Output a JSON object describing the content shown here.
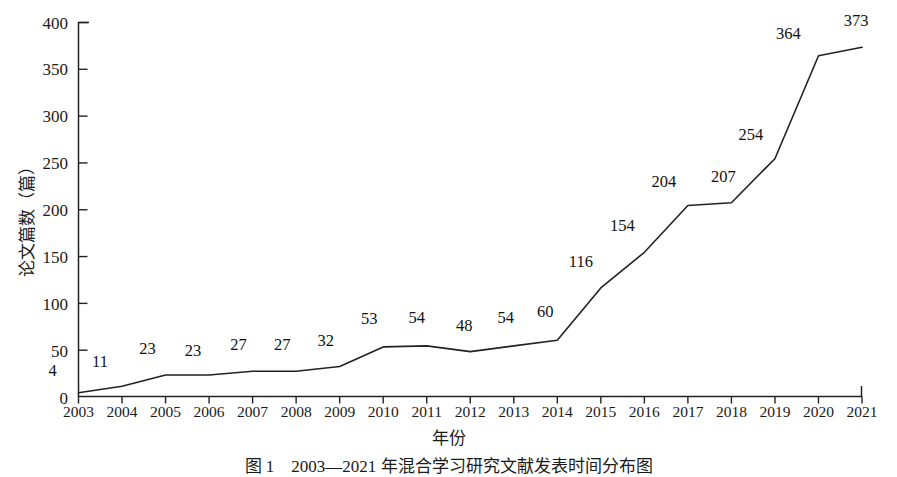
{
  "chart_data": {
    "type": "line",
    "title": "",
    "xlabel": "年份",
    "ylabel": "论文篇数（篇）",
    "categories": [
      "2003",
      "2004",
      "2005",
      "2006",
      "2007",
      "2008",
      "2009",
      "2010",
      "2011",
      "2012",
      "2013",
      "2014",
      "2015",
      "2016",
      "2017",
      "2018",
      "2019",
      "2020",
      "2021"
    ],
    "values": [
      4,
      11,
      23,
      23,
      27,
      27,
      32,
      53,
      54,
      48,
      54,
      60,
      116,
      154,
      204,
      207,
      254,
      364,
      373
    ],
    "series": [
      {
        "name": "论文篇数",
        "values": [
          4,
          11,
          23,
          23,
          27,
          27,
          32,
          53,
          54,
          48,
          54,
          60,
          116,
          154,
          204,
          207,
          254,
          364,
          373
        ]
      }
    ],
    "ylim": [
      0,
      400
    ],
    "ytick_labels": [
      "0",
      "50",
      "100",
      "150",
      "200",
      "250",
      "300",
      "350",
      "400"
    ],
    "ytick_values": [
      0,
      50,
      100,
      150,
      200,
      250,
      300,
      350,
      400
    ],
    "xlim": [
      "2003",
      "2021"
    ],
    "grid": false,
    "legend": false,
    "data_labels": true,
    "line_color": "#222222",
    "line_width": 1.6,
    "markers": false,
    "axis_color": "#222222"
  },
  "caption": {
    "text": "图 1　2003—2021 年混合学习研究文献发表时间分布图"
  }
}
